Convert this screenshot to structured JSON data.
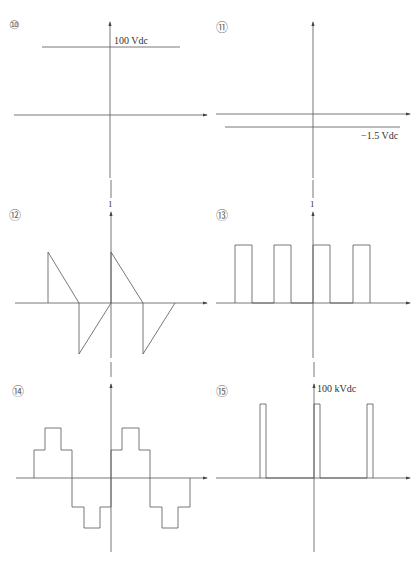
{
  "panels": [
    {
      "id": "10",
      "number_label": "⑩",
      "annotation": "100 Vdc",
      "waveform": "constant positive DC level"
    },
    {
      "id": "11",
      "number_label": "⑪",
      "annotation": "−1.5 Vdc",
      "waveform": "constant negative DC level"
    },
    {
      "id": "12",
      "number_label": "⑫",
      "annotation": "1",
      "waveform": "bipolar sawtooth"
    },
    {
      "id": "13",
      "number_label": "⑬",
      "annotation": "1",
      "waveform": "unipolar rectangular pulse train"
    },
    {
      "id": "14",
      "number_label": "⑭",
      "annotation": "",
      "waveform": "stepped (staircase) sine approximation"
    },
    {
      "id": "15",
      "number_label": "⑮",
      "annotation": "100 kVdc",
      "waveform": "narrow high-voltage pulses"
    }
  ],
  "colors": {
    "line": "#555555",
    "background": "#ffffff",
    "text": "#333333"
  }
}
